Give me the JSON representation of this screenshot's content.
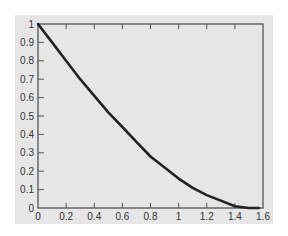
{
  "chart_data": {
    "type": "line",
    "title": "",
    "xlabel": "",
    "ylabel": "",
    "xlim": [
      0,
      1.6
    ],
    "ylim": [
      0,
      1
    ],
    "grid": false,
    "legend": null,
    "x_ticks": [
      "0",
      "0.2",
      "0.4",
      "0.6",
      "0.8",
      "1",
      "1.2",
      "1.4",
      "1.6"
    ],
    "y_ticks": [
      "0",
      "0.1",
      "0.2",
      "0.3",
      "0.4",
      "0.5",
      "0.6",
      "0.7",
      "0.8",
      "0.9",
      "1"
    ],
    "series": [
      {
        "name": "curve",
        "description": "decreasing curve from (0,1) to (~1.57,0), approximately y = 1 - sin(x)",
        "x": [
          0,
          0.1,
          0.2,
          0.3,
          0.4,
          0.5,
          0.6,
          0.7,
          0.8,
          0.9,
          1.0,
          1.1,
          1.2,
          1.3,
          1.4,
          1.5,
          1.57
        ],
        "y": [
          1.0,
          0.9,
          0.8,
          0.7,
          0.61,
          0.52,
          0.44,
          0.36,
          0.28,
          0.22,
          0.16,
          0.11,
          0.07,
          0.04,
          0.01,
          0.0,
          0.0
        ]
      }
    ],
    "colors": {
      "panel_bg": "#e6e6e6",
      "axis": "#555555",
      "line": "#222222"
    }
  }
}
